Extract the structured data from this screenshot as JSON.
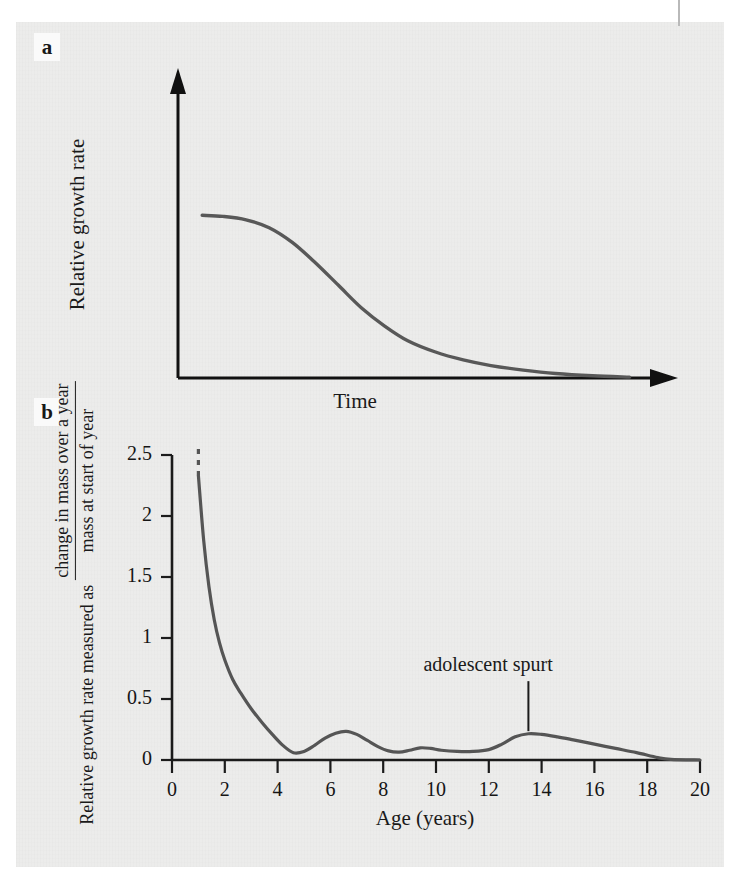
{
  "figure": {
    "panels": [
      {
        "letter": "a",
        "ylabel": "Relative growth rate",
        "xlabel": "Time"
      },
      {
        "letter": "b",
        "ylabel_lead": "Relative growth rate measured as",
        "ylabel_numerator": "change in mass over a year",
        "ylabel_denominator": "mass at start of year",
        "xlabel": "Age (years)",
        "annotation": "adolescent spurt"
      }
    ]
  },
  "chart_data": [
    {
      "type": "line",
      "panel": "a",
      "title": "",
      "xlabel": "Time",
      "ylabel": "Relative growth rate",
      "axes_style": "arrows",
      "grid": false,
      "xticks": [],
      "yticks": [],
      "xlim": [
        0,
        10
      ],
      "ylim": [
        0,
        1
      ],
      "series": [
        {
          "name": "relative growth rate",
          "x": [
            0.35,
            0.8,
            1.3,
            1.8,
            2.3,
            2.8,
            3.3,
            3.8,
            4.3,
            4.8,
            5.4,
            6.0,
            6.6,
            7.3,
            8.0,
            8.8,
            9.6
          ],
          "y": [
            0.72,
            0.715,
            0.7,
            0.665,
            0.6,
            0.51,
            0.41,
            0.31,
            0.23,
            0.165,
            0.115,
            0.08,
            0.055,
            0.035,
            0.02,
            0.01,
            0.004
          ]
        }
      ]
    },
    {
      "type": "line",
      "panel": "b",
      "title": "",
      "xlabel": "Age (years)",
      "ylabel": "Relative growth rate measured as change in mass over a year / mass at start of year",
      "grid": false,
      "xlim": [
        0,
        20
      ],
      "ylim": [
        0,
        2.5
      ],
      "xticks": [
        0,
        2,
        4,
        6,
        8,
        10,
        12,
        14,
        16,
        18,
        20
      ],
      "xtick_labels": [
        "0",
        "2",
        "4",
        "6",
        "8",
        "10",
        "12",
        "14",
        "16",
        "18",
        "20"
      ],
      "yticks": [
        0,
        0.5,
        1,
        1.5,
        2,
        2.5
      ],
      "ytick_labels": [
        "0",
        "0.5",
        "1",
        "1.5",
        "2",
        "2.5"
      ],
      "annotations": [
        {
          "text": "adolescent spurt",
          "x": 13.5,
          "y": 0.22,
          "leader": true
        }
      ],
      "series": [
        {
          "name": "relative growth rate",
          "dashed_above": 2.33,
          "x": [
            1.0,
            1.2,
            1.4,
            1.6,
            1.8,
            2.0,
            2.3,
            2.6,
            3.0,
            3.4,
            3.8,
            4.2,
            4.6,
            5.0,
            5.4,
            5.8,
            6.2,
            6.6,
            7.0,
            7.4,
            7.8,
            8.2,
            8.6,
            9.0,
            9.4,
            9.8,
            10.2,
            10.8,
            11.4,
            12.0,
            12.5,
            13.0,
            13.5,
            14.0,
            14.6,
            15.2,
            16.0,
            16.8,
            17.6,
            18.4,
            18.9,
            20.0
          ],
          "y": [
            2.33,
            1.8,
            1.42,
            1.15,
            0.96,
            0.82,
            0.66,
            0.55,
            0.42,
            0.31,
            0.21,
            0.12,
            0.06,
            0.07,
            0.12,
            0.18,
            0.22,
            0.235,
            0.21,
            0.16,
            0.11,
            0.075,
            0.065,
            0.08,
            0.1,
            0.095,
            0.08,
            0.07,
            0.07,
            0.085,
            0.13,
            0.19,
            0.215,
            0.21,
            0.19,
            0.165,
            0.13,
            0.095,
            0.06,
            0.02,
            0.005,
            0.0
          ]
        }
      ]
    }
  ]
}
